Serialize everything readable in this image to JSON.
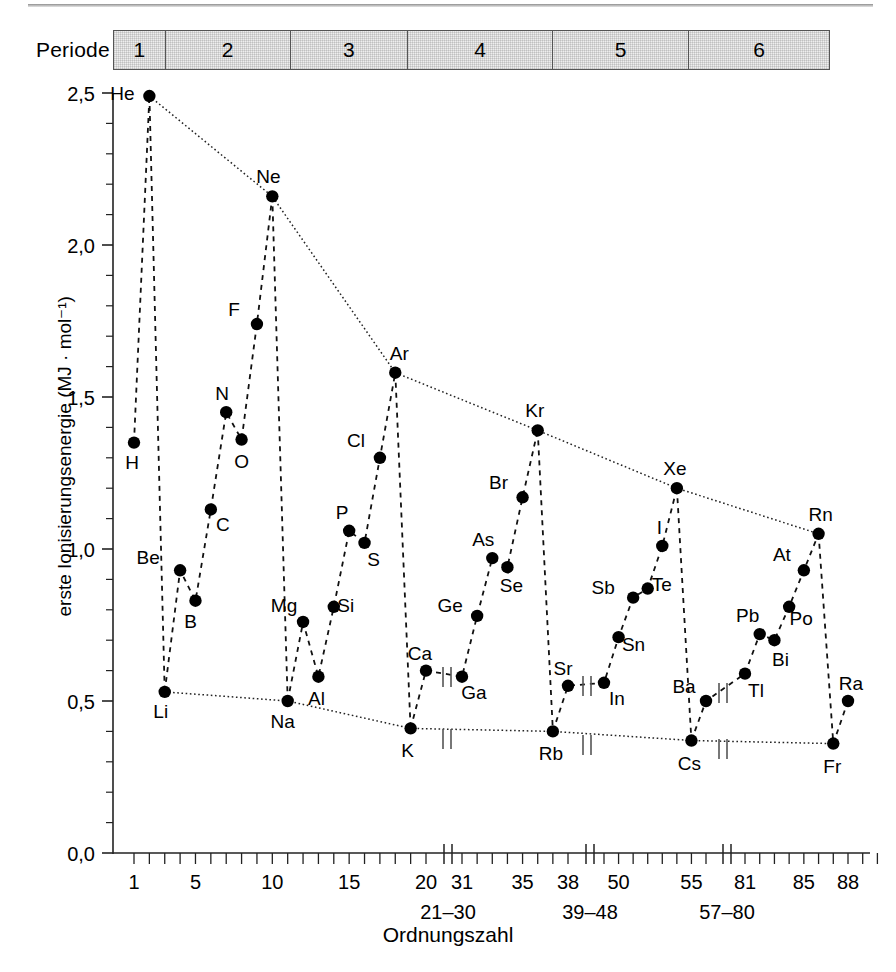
{
  "figure": {
    "ylabel": "erste Ionisierungsenergie (MJ · mol⁻¹)",
    "xlabel": "Ordnungszahl",
    "period_label": "Periode"
  },
  "period_bar": {
    "cells": [
      {
        "label": "1",
        "start": 1,
        "end": 2
      },
      {
        "label": "2",
        "start": 3,
        "end": 10
      },
      {
        "label": "3",
        "start": 11,
        "end": 18
      },
      {
        "label": "4",
        "start": 19,
        "end": 36
      },
      {
        "label": "5",
        "start": 37,
        "end": 54
      },
      {
        "label": "6",
        "start": 55,
        "end": 86
      }
    ]
  },
  "chart_data": {
    "type": "line",
    "title": "",
    "xlabel": "Ordnungszahl",
    "ylabel": "erste Ionisierungsenergie (MJ · mol⁻¹)",
    "ylim": [
      0.0,
      2.5
    ],
    "yticks": [
      "0,0",
      "0,5",
      "1,0",
      "1,5",
      "2,0",
      "2,5"
    ],
    "ytick_values": [
      0.0,
      0.5,
      1.0,
      1.5,
      2.0,
      2.5
    ],
    "y_minor_step": 0.1,
    "xticks_major": [
      "1",
      "5",
      "10",
      "15",
      "20",
      "31",
      "35",
      "38",
      "50",
      "55",
      "81",
      "85",
      "88"
    ],
    "xtick_gap_labels": [
      "21–30",
      "39–48",
      "57–80"
    ],
    "axis_breaks": [
      {
        "after": 20,
        "before": 31,
        "gap_label": "21–30"
      },
      {
        "after": 38,
        "before": 39,
        "gap_label": "39–48"
      },
      {
        "after": 56,
        "before": 81,
        "gap_label": "57–80"
      }
    ],
    "grid": false,
    "legend": null,
    "series": [
      {
        "name": "erste Ionisierungsenergie",
        "points": [
          {
            "symbol": "H",
            "z": 1,
            "value": 1.35,
            "label_dx": -2,
            "label_dy": 26
          },
          {
            "symbol": "He",
            "z": 2,
            "value": 2.49,
            "label_dx": -27,
            "label_dy": 4
          },
          {
            "symbol": "Li",
            "z": 3,
            "value": 0.53,
            "label_dx": -4,
            "label_dy": 26
          },
          {
            "symbol": "Be",
            "z": 4,
            "value": 0.93,
            "label_dx": -32,
            "label_dy": -6
          },
          {
            "symbol": "B",
            "z": 5,
            "value": 0.83,
            "label_dx": -5,
            "label_dy": 27
          },
          {
            "symbol": "C",
            "z": 6,
            "value": 1.13,
            "label_dx": 12,
            "label_dy": 22
          },
          {
            "symbol": "N",
            "z": 7,
            "value": 1.45,
            "label_dx": -4,
            "label_dy": -12
          },
          {
            "symbol": "O",
            "z": 8,
            "value": 1.36,
            "label_dx": 0,
            "label_dy": 28
          },
          {
            "symbol": "F",
            "z": 9,
            "value": 1.74,
            "label_dx": -23,
            "label_dy": -8
          },
          {
            "symbol": "Ne",
            "z": 10,
            "value": 2.16,
            "label_dx": -4,
            "label_dy": -13
          },
          {
            "symbol": "Na",
            "z": 11,
            "value": 0.5,
            "label_dx": -5,
            "label_dy": 27
          },
          {
            "symbol": "Mg",
            "z": 12,
            "value": 0.76,
            "label_dx": -19,
            "label_dy": -10
          },
          {
            "symbol": "Al",
            "z": 13,
            "value": 0.58,
            "label_dx": -2,
            "label_dy": 28
          },
          {
            "symbol": "Si",
            "z": 14,
            "value": 0.81,
            "label_dx": 12,
            "label_dy": 5
          },
          {
            "symbol": "P",
            "z": 15,
            "value": 1.06,
            "label_dx": -7,
            "label_dy": -12
          },
          {
            "symbol": "S",
            "z": 16,
            "value": 1.02,
            "label_dx": 9,
            "label_dy": 23
          },
          {
            "symbol": "Cl",
            "z": 17,
            "value": 1.3,
            "label_dx": -24,
            "label_dy": -11
          },
          {
            "symbol": "Ar",
            "z": 18,
            "value": 1.58,
            "label_dx": 4,
            "label_dy": -13
          },
          {
            "symbol": "K",
            "z": 19,
            "value": 0.41,
            "label_dx": -3,
            "label_dy": 29
          },
          {
            "symbol": "Ca",
            "z": 20,
            "value": 0.6,
            "label_dx": -6,
            "label_dy": -11
          },
          {
            "symbol": "Ga",
            "z": 31,
            "value": 0.58,
            "label_dx": 12,
            "label_dy": 22
          },
          {
            "symbol": "Ge",
            "z": 32,
            "value": 0.78,
            "label_dx": -27,
            "label_dy": -4
          },
          {
            "symbol": "As",
            "z": 33,
            "value": 0.97,
            "label_dx": -9,
            "label_dy": -12
          },
          {
            "symbol": "Se",
            "z": 34,
            "value": 0.94,
            "label_dx": 4,
            "label_dy": 25
          },
          {
            "symbol": "Br",
            "z": 35,
            "value": 1.17,
            "label_dx": -24,
            "label_dy": -8
          },
          {
            "symbol": "Kr",
            "z": 36,
            "value": 1.39,
            "label_dx": -3,
            "label_dy": -13
          },
          {
            "symbol": "Rb",
            "z": 37,
            "value": 0.4,
            "label_dx": -2,
            "label_dy": 29
          },
          {
            "symbol": "Sr",
            "z": 38,
            "value": 0.55,
            "label_dx": -5,
            "label_dy": -11
          },
          {
            "symbol": "In",
            "z": 49,
            "value": 0.56,
            "label_dx": 13,
            "label_dy": 22
          },
          {
            "symbol": "Sn",
            "z": 50,
            "value": 0.71,
            "label_dx": 15,
            "label_dy": 14
          },
          {
            "symbol": "Sb",
            "z": 51,
            "value": 0.84,
            "label_dx": -30,
            "label_dy": -4
          },
          {
            "symbol": "Te",
            "z": 52,
            "value": 0.87,
            "label_dx": 14,
            "label_dy": 2
          },
          {
            "symbol": "I",
            "z": 53,
            "value": 1.01,
            "label_dx": -3,
            "label_dy": -12
          },
          {
            "symbol": "Xe",
            "z": 54,
            "value": 1.2,
            "label_dx": -2,
            "label_dy": -13
          },
          {
            "symbol": "Cs",
            "z": 55,
            "value": 0.37,
            "label_dx": -2,
            "label_dy": 29
          },
          {
            "symbol": "Ba",
            "z": 56,
            "value": 0.5,
            "label_dx": -22,
            "label_dy": -8
          },
          {
            "symbol": "Tl",
            "z": 81,
            "value": 0.59,
            "label_dx": 11,
            "label_dy": 23
          },
          {
            "symbol": "Pb",
            "z": 82,
            "value": 0.72,
            "label_dx": -12,
            "label_dy": -12
          },
          {
            "symbol": "Bi",
            "z": 83,
            "value": 0.7,
            "label_dx": 6,
            "label_dy": 26
          },
          {
            "symbol": "Po",
            "z": 84,
            "value": 0.81,
            "label_dx": 12,
            "label_dy": 18
          },
          {
            "symbol": "At",
            "z": 85,
            "value": 0.93,
            "label_dx": -22,
            "label_dy": -9
          },
          {
            "symbol": "Rn",
            "z": 86,
            "value": 1.05,
            "label_dx": 2,
            "label_dy": -13
          },
          {
            "symbol": "Fr",
            "z": 87,
            "value": 0.36,
            "label_dx": -1,
            "label_dy": 29
          },
          {
            "symbol": "Ra",
            "z": 88,
            "value": 0.5,
            "label_dx": 3,
            "label_dy": -11
          }
        ]
      }
    ],
    "noble_gas_envelope": [
      "He",
      "Ne",
      "Ar",
      "Kr",
      "Xe",
      "Rn"
    ],
    "alkali_envelope": [
      "Li",
      "Na",
      "K",
      "Rb",
      "Cs",
      "Fr"
    ],
    "colors": {
      "marker": "#000000",
      "line": "#1a1a1a",
      "period_bar_fill": "#eeeeee"
    }
  }
}
